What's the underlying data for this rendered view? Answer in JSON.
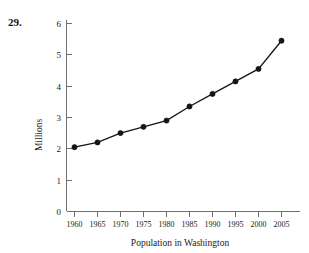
{
  "problem": {
    "number": "29."
  },
  "chart_data": {
    "type": "line",
    "title": "",
    "subtitle": "",
    "xlabel": "Population in Washington",
    "ylabel": "Millions",
    "categories": [
      "1960",
      "1965",
      "1970",
      "1975",
      "1980",
      "1985",
      "1990",
      "1995",
      "2000",
      "2005"
    ],
    "x": [
      1960,
      1965,
      1970,
      1975,
      1980,
      1985,
      1990,
      1995,
      2000,
      2005
    ],
    "values": [
      2.05,
      2.2,
      2.5,
      2.7,
      2.9,
      3.35,
      3.75,
      4.15,
      4.55,
      5.45
    ],
    "series": [
      {
        "name": "Population",
        "values": [
          2.05,
          2.2,
          2.5,
          2.7,
          2.9,
          3.35,
          3.75,
          4.15,
          4.55,
          5.45
        ]
      }
    ],
    "ylim": [
      0,
      6
    ],
    "xlim": [
      1960,
      2005
    ],
    "yticks": [
      0,
      1,
      2,
      3,
      4,
      5,
      6
    ],
    "ytick_labels": [
      "0",
      "1",
      "2",
      "3",
      "4",
      "5",
      "6"
    ],
    "xtick_labels": [
      "1960",
      "1965",
      "1970",
      "1975",
      "1980",
      "1985",
      "1990",
      "1995",
      "2000",
      "2005"
    ],
    "grid": false,
    "legend": false,
    "legend_position": "none",
    "marker": "filled-circle",
    "line_color": "#151515",
    "marker_color": "#151515",
    "axis_color": "#6f6f6f",
    "background_color": "#ffffff"
  }
}
